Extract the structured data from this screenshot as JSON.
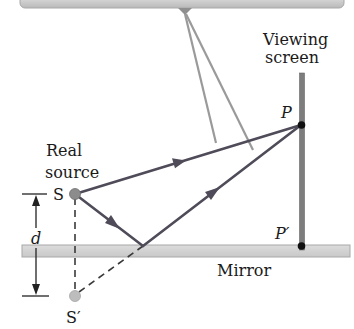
{
  "diagram": {
    "labels": {
      "viewing_screen_line1": "Viewing",
      "viewing_screen_line2": "screen",
      "real_source_line1": "Real",
      "real_source_line2": "source",
      "source": "S",
      "image_source": "S′",
      "point_p": "P",
      "point_p_prime": "P′",
      "separation": "d",
      "mirror": "Mirror"
    },
    "colors": {
      "ray": "#4f4b58",
      "arm": "#9a9a9a",
      "mirror_fill": "#d4d4d4",
      "mirror_edge": "#a8a8a8",
      "screen": "#7d7d7d",
      "source_dot": "#8c8c8c",
      "image_dot": "#bdbdbd",
      "top_bar": "#cfcfcf",
      "point": "#111111"
    },
    "geometry": {
      "source": [
        75,
        194
      ],
      "image_source": [
        75,
        296
      ],
      "reflection_point": [
        143,
        246
      ],
      "point_p": [
        301,
        125
      ],
      "point_p_prime": [
        301,
        246
      ],
      "mirror_y": 251,
      "screen_x": 302
    }
  }
}
